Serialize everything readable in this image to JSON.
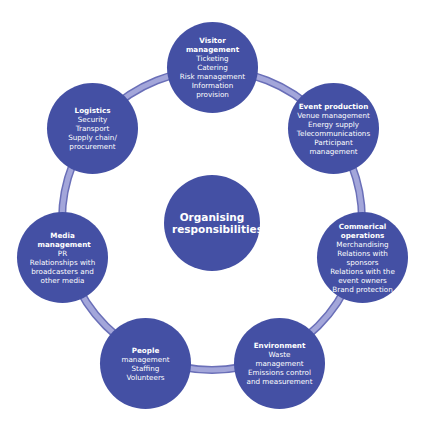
{
  "diagram": {
    "center": {
      "title": "Organising responsibilities"
    },
    "colors": {
      "node": "#4450a4",
      "ring": "#9c9fd6",
      "ring_edge": "#6a6fb8"
    },
    "nodes": [
      {
        "title": "Visitor management",
        "items": [
          "Ticketing",
          "Catering",
          "Risk management",
          "Information provision"
        ]
      },
      {
        "title": "Event production",
        "items": [
          "Venue management",
          "Energy supply",
          "Telecommunications",
          "Participant management"
        ]
      },
      {
        "title": "Commerical operations",
        "items": [
          "Merchandising",
          "Relations with sponsors",
          "Relations with the event owners",
          "Brand protection"
        ]
      },
      {
        "title": "Environment",
        "items": [
          "Waste management",
          "Emissions control and measurement"
        ]
      },
      {
        "title": "People",
        "items": [
          "management",
          "Staffing",
          "Volunteers"
        ]
      },
      {
        "title": "Media management",
        "items": [
          "PR",
          "Relationships with broadcasters and other media"
        ]
      },
      {
        "title": "Logistics",
        "items": [
          "Security",
          "Transport",
          "Supply chain/ procurement"
        ]
      }
    ]
  }
}
